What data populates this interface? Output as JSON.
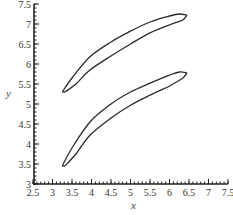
{
  "chart_data": {
    "type": "line",
    "title": "",
    "xlabel": "x",
    "ylabel": "y",
    "xlim": [
      2.5,
      7.5
    ],
    "ylim": [
      3,
      7.5
    ],
    "grid": false,
    "legend": null,
    "x_ticks": [
      "2.5",
      "3",
      "3.5",
      "4",
      "4.5",
      "5",
      "5.5",
      "6",
      "6.5",
      "7",
      "7.5"
    ],
    "y_ticks": [
      "3",
      "3.5",
      "4",
      "4.5",
      "5",
      "5.5",
      "6",
      "6.5",
      "7",
      "7.5"
    ],
    "series": [
      {
        "name": "upper loop - outer branch",
        "x": [
          3.25,
          3.5,
          3.96,
          4.5,
          5.0,
          5.5,
          6.0,
          6.25,
          6.45
        ],
        "y": [
          5.3,
          5.65,
          6.18,
          6.55,
          6.82,
          7.05,
          7.2,
          7.25,
          7.22
        ]
      },
      {
        "name": "upper loop - inner branch",
        "x": [
          3.32,
          3.6,
          3.96,
          4.5,
          5.0,
          5.5,
          6.0,
          6.35
        ],
        "y": [
          5.3,
          5.5,
          5.85,
          6.2,
          6.5,
          6.78,
          6.98,
          7.1
        ]
      },
      {
        "name": "lower loop - outer branch",
        "x": [
          3.25,
          3.5,
          3.96,
          4.5,
          5.0,
          5.5,
          6.0,
          6.25,
          6.45
        ],
        "y": [
          3.45,
          3.9,
          4.55,
          5.0,
          5.3,
          5.52,
          5.72,
          5.8,
          5.78
        ]
      },
      {
        "name": "lower loop - inner branch",
        "x": [
          3.32,
          3.6,
          3.96,
          4.5,
          5.0,
          5.5,
          6.0,
          6.35
        ],
        "y": [
          3.45,
          3.75,
          4.22,
          4.65,
          4.97,
          5.22,
          5.45,
          5.65
        ]
      }
    ]
  }
}
